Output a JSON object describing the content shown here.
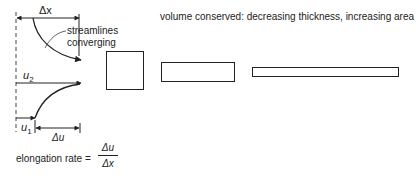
{
  "diagram": {
    "labels": {
      "delta_x": "Δx",
      "streamlines": "streamlines",
      "converging": "converging",
      "u2": "u",
      "u2_sub": "2",
      "u1": "u",
      "u1_sub": "1",
      "delta_u": "Δu",
      "volume_note": "volume conserved:  decreasing thickness, increasing area",
      "elongation_label": "elongation rate =",
      "frac_numerator": "Δu",
      "frac_denominator": "Δx"
    },
    "shapes": [
      {
        "name": "square",
        "description": "thick element"
      },
      {
        "name": "medium-rectangle",
        "description": "thinner, wider element"
      },
      {
        "name": "thin-rectangle",
        "description": "thinnest, widest element"
      }
    ],
    "colors": {
      "ink": "#222222",
      "background": "#ffffff"
    }
  }
}
